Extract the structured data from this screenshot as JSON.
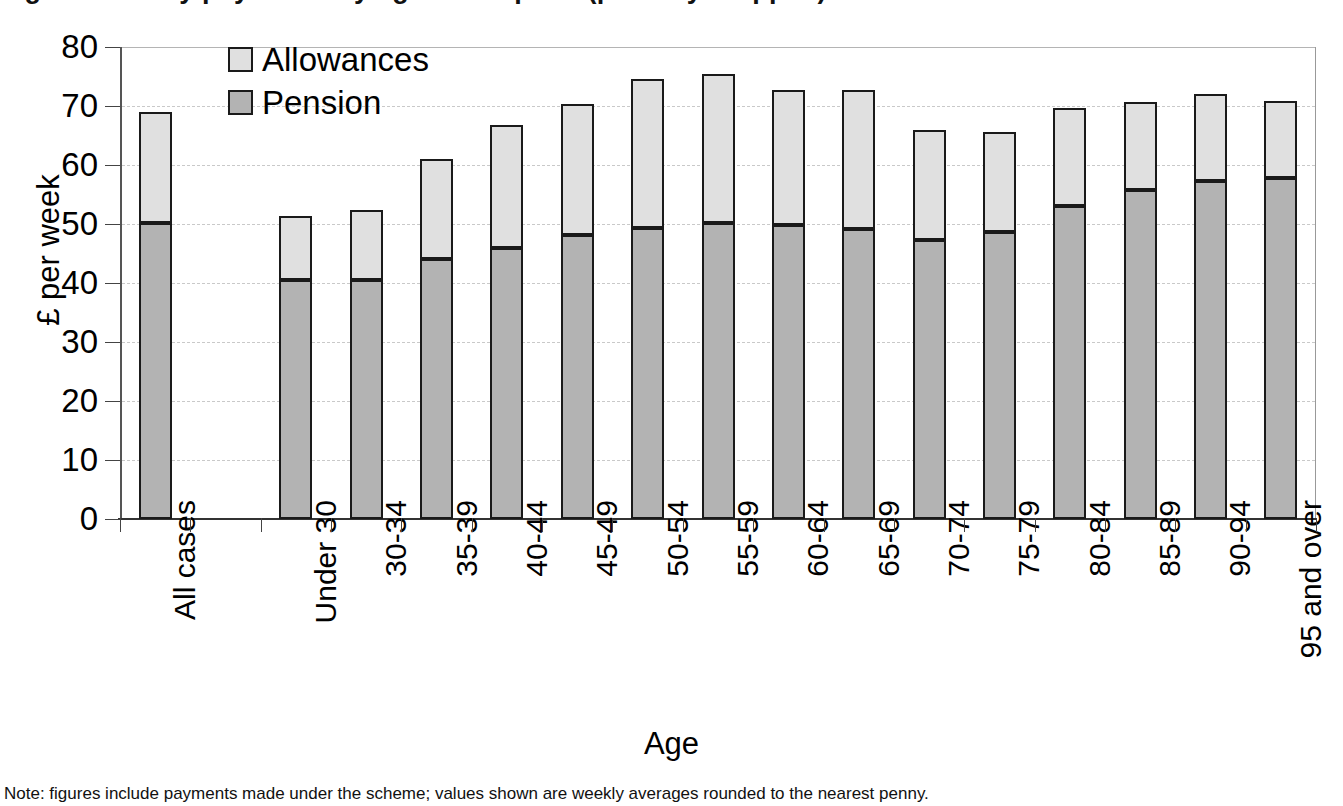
{
  "figure": {
    "title_fragment": "Figure: Weekly payments by age of recipient (partially cropped)",
    "caption_fragment": "Note: figures include payments made under the scheme; values shown are weekly averages rounded to the nearest penny.",
    "xaxis_title": "Age",
    "yaxis_title": "£ per week"
  },
  "legend": {
    "position": "top-left-inside",
    "items": [
      {
        "label": "Allowances",
        "color": "#e0e0e0",
        "icon": "square-swatch-icon"
      },
      {
        "label": "Pension",
        "color": "#b3b3b3",
        "icon": "square-swatch-icon"
      }
    ]
  },
  "chart_data": {
    "type": "bar",
    "stacked": true,
    "title": "Weekly payments by age of recipient",
    "xlabel": "Age",
    "ylabel": "£ per week",
    "ylim": [
      0,
      80
    ],
    "ytick_step": 10,
    "yticks": [
      "0",
      "10",
      "20",
      "30",
      "40",
      "50",
      "60",
      "70",
      "80"
    ],
    "grid": "horizontal-dashed",
    "legend_position": "top-left-inside",
    "categories": [
      "All cases",
      "",
      "Under 30",
      "30-34",
      "35-39",
      "40-44",
      "45-49",
      "50-54",
      "55-59",
      "60-64",
      "65-69",
      "70-74",
      "75-79",
      "80-84",
      "85-89",
      "90-94",
      "95 and over"
    ],
    "series": [
      {
        "name": "Pension",
        "color": "#b3b3b3",
        "values": [
          50.2,
          null,
          40.5,
          40.5,
          44.1,
          46.0,
          48.1,
          49.4,
          50.1,
          49.8,
          49.2,
          47.3,
          48.6,
          53.0,
          55.7,
          57.3,
          57.8
        ]
      },
      {
        "name": "Allowances",
        "color": "#e0e0e0",
        "values": [
          18.8,
          null,
          10.9,
          11.8,
          17.0,
          20.7,
          22.2,
          25.2,
          25.4,
          22.9,
          23.5,
          18.7,
          17.0,
          16.6,
          15.0,
          14.8,
          13.0
        ]
      }
    ],
    "totals": [
      69.0,
      null,
      51.4,
      52.3,
      61.1,
      66.7,
      70.3,
      74.6,
      75.5,
      72.7,
      72.7,
      66.0,
      65.6,
      69.6,
      70.7,
      72.1,
      70.8
    ]
  }
}
